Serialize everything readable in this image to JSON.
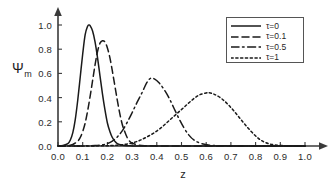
{
  "chart_data": {
    "type": "line",
    "title": "",
    "xlabel": "z",
    "ylabel": "Ψm",
    "ylabel_base": "Ψ",
    "ylabel_sub": "m",
    "xlim": [
      0.0,
      1.0
    ],
    "ylim": [
      0.0,
      1.0
    ],
    "grid": false,
    "legend_position": "top-right",
    "xticks": [
      "0.0",
      "0.1",
      "0.2",
      "0.3",
      "0.4",
      "0.5",
      "0.6",
      "0.7",
      "0.8",
      "0.9",
      "1.0"
    ],
    "xtick_values": [
      0.0,
      0.1,
      0.2,
      0.3,
      0.4,
      0.5,
      0.6,
      0.7,
      0.8,
      0.9,
      1.0
    ],
    "yticks": [
      "0.0",
      "0.2",
      "0.4",
      "0.6",
      "0.8",
      "1.0"
    ],
    "ytick_values": [
      0.0,
      0.2,
      0.4,
      0.6,
      0.8,
      1.0
    ],
    "series": [
      {
        "name": "τ=0",
        "style": "solid",
        "peak_x": 0.125,
        "peak_y": 1.0,
        "x": [
          0.0,
          0.02,
          0.04,
          0.05,
          0.06,
          0.07,
          0.08,
          0.09,
          0.1,
          0.11,
          0.12,
          0.125,
          0.13,
          0.14,
          0.15,
          0.16,
          0.17,
          0.18,
          0.19,
          0.2,
          0.21,
          0.22,
          0.23,
          0.24,
          0.25,
          0.26,
          0.28,
          0.3,
          0.35,
          0.45,
          0.6,
          0.8,
          1.0
        ],
        "y": [
          0.0,
          0.005,
          0.02,
          0.05,
          0.11,
          0.22,
          0.38,
          0.57,
          0.76,
          0.92,
          0.99,
          1.0,
          0.995,
          0.95,
          0.86,
          0.73,
          0.58,
          0.43,
          0.3,
          0.19,
          0.12,
          0.07,
          0.04,
          0.02,
          0.012,
          0.006,
          0.002,
          0.001,
          0.0,
          0.0,
          0.0,
          0.0,
          0.0
        ]
      },
      {
        "name": "τ=0.1",
        "style": "dashed",
        "peak_x": 0.18,
        "peak_y": 0.87,
        "x": [
          0.0,
          0.04,
          0.06,
          0.08,
          0.09,
          0.1,
          0.11,
          0.12,
          0.13,
          0.14,
          0.15,
          0.16,
          0.17,
          0.18,
          0.19,
          0.2,
          0.21,
          0.22,
          0.23,
          0.24,
          0.25,
          0.26,
          0.27,
          0.28,
          0.29,
          0.3,
          0.32,
          0.35,
          0.4,
          0.5,
          0.7,
          1.0
        ],
        "y": [
          0.0,
          0.004,
          0.012,
          0.04,
          0.07,
          0.12,
          0.19,
          0.29,
          0.41,
          0.54,
          0.67,
          0.78,
          0.85,
          0.87,
          0.86,
          0.81,
          0.73,
          0.62,
          0.5,
          0.38,
          0.27,
          0.18,
          0.12,
          0.07,
          0.04,
          0.025,
          0.01,
          0.003,
          0.001,
          0.0,
          0.0,
          0.0
        ]
      },
      {
        "name": "τ=0.5",
        "style": "dashdot",
        "peak_x": 0.375,
        "peak_y": 0.56,
        "x": [
          0.0,
          0.1,
          0.15,
          0.18,
          0.2,
          0.22,
          0.24,
          0.26,
          0.28,
          0.3,
          0.32,
          0.34,
          0.36,
          0.375,
          0.39,
          0.41,
          0.43,
          0.45,
          0.47,
          0.49,
          0.51,
          0.53,
          0.55,
          0.58,
          0.62,
          0.7,
          0.85,
          1.0
        ],
        "y": [
          0.0,
          0.001,
          0.004,
          0.01,
          0.02,
          0.04,
          0.075,
          0.125,
          0.195,
          0.275,
          0.36,
          0.44,
          0.525,
          0.56,
          0.555,
          0.52,
          0.465,
          0.395,
          0.31,
          0.225,
          0.15,
          0.09,
          0.05,
          0.02,
          0.006,
          0.001,
          0.0,
          0.0
        ]
      },
      {
        "name": "τ=1",
        "style": "dotted",
        "peak_x": 0.61,
        "peak_y": 0.44,
        "x": [
          0.0,
          0.15,
          0.22,
          0.26,
          0.3,
          0.33,
          0.36,
          0.39,
          0.42,
          0.45,
          0.48,
          0.51,
          0.54,
          0.57,
          0.6,
          0.61,
          0.63,
          0.66,
          0.69,
          0.72,
          0.75,
          0.78,
          0.81,
          0.84,
          0.88,
          0.94,
          1.0
        ],
        "y": [
          0.0,
          0.001,
          0.004,
          0.01,
          0.025,
          0.045,
          0.075,
          0.11,
          0.155,
          0.21,
          0.265,
          0.32,
          0.375,
          0.42,
          0.438,
          0.44,
          0.43,
          0.395,
          0.34,
          0.27,
          0.195,
          0.125,
          0.065,
          0.028,
          0.008,
          0.001,
          0.0
        ]
      }
    ]
  },
  "legend": {
    "entries": [
      {
        "label": "τ=0",
        "style": "solid"
      },
      {
        "label": "τ=0.1",
        "style": "dashed"
      },
      {
        "label": "τ=0.5",
        "style": "dashdot"
      },
      {
        "label": "τ=1",
        "style": "dotted"
      }
    ]
  }
}
